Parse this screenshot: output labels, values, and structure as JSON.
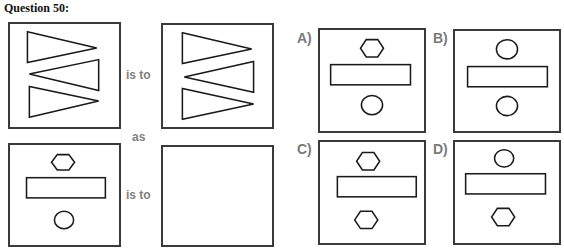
{
  "title": "Question 50:",
  "connectors": {
    "is_to_1": "is to",
    "as": "as",
    "is_to_2": "is to"
  },
  "options": {
    "a": "A)",
    "b": "B)",
    "c": "C)",
    "d": "D)"
  },
  "figures": {
    "box1": "three triangles: right-pointing, left-pointing, right-pointing",
    "box2": "three triangles: right-pointing, left-pointing, right-pointing",
    "box3": "hexagon top, rectangle middle, circle bottom",
    "box4": "empty",
    "option_a": "hexagon top, rectangle middle, circle bottom",
    "option_b": "circle top, rectangle middle, circle bottom",
    "option_c": "hexagon top, rectangle middle, hexagon bottom",
    "option_d": "circle top, rectangle middle, hexagon bottom"
  },
  "colors": {
    "stroke": "#1a1a1a",
    "border": "#3a3a3a",
    "connector_text": "#808080"
  }
}
